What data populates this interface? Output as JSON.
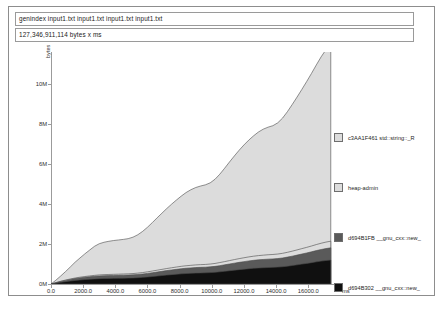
{
  "window": {
    "title": "massif memory profile"
  },
  "header": {
    "command_line": "genindex input1.txt input1.txt input1.txt input1.txt",
    "total_label": "127,346,911,114 bytes x ms"
  },
  "chart_data": {
    "type": "area",
    "title": "",
    "subtitle": "",
    "xlabel": "ms",
    "ylabel": "bytes",
    "grid": false,
    "legend_position": "right",
    "xlim": [
      0,
      17600
    ],
    "ylim": [
      0,
      11600000
    ],
    "xticks": [
      0,
      2000,
      4000,
      6000,
      8000,
      10000,
      12000,
      14000,
      16000
    ],
    "xticklabels": [
      "0.0",
      "2000.0",
      "4000.0",
      "6000.0",
      "8000.0",
      "10000.0",
      "12000.0",
      "14000.0",
      "16000.0"
    ],
    "yticks": [
      0,
      2000000,
      4000000,
      6000000,
      8000000,
      10000000
    ],
    "yticklabels": [
      "0M",
      "2M",
      "4M",
      "6M",
      "8M",
      "10M"
    ],
    "x": [
      0,
      300,
      600,
      900,
      1200,
      1500,
      1800,
      2100,
      2400,
      2700,
      3000,
      3300,
      3600,
      3900,
      4200,
      4500,
      4800,
      5100,
      5400,
      5700,
      6000,
      6300,
      6600,
      6900,
      7200,
      7500,
      7800,
      8100,
      8400,
      8700,
      9000,
      9300,
      9600,
      9900,
      10200,
      10500,
      10800,
      11100,
      11400,
      11700,
      12000,
      12300,
      12600,
      12900,
      13200,
      13500,
      13800,
      14100,
      14400,
      14700,
      15000,
      15300,
      15600,
      15900,
      16200,
      16500,
      16800,
      17100,
      17400
    ],
    "series": [
      {
        "name": "c3AA1F461 std::string::_R",
        "color": "#dcdcdc",
        "values": [
          0,
          120000,
          260000,
          420000,
          600000,
          790000,
          960000,
          1130000,
          1290000,
          1450000,
          1560000,
          1620000,
          1660000,
          1690000,
          1710000,
          1730000,
          1760000,
          1820000,
          1920000,
          2060000,
          2230000,
          2420000,
          2620000,
          2810000,
          3000000,
          3180000,
          3350000,
          3510000,
          3660000,
          3780000,
          3870000,
          3930000,
          3980000,
          4060000,
          4210000,
          4420000,
          4670000,
          4930000,
          5180000,
          5420000,
          5640000,
          5840000,
          6020000,
          6180000,
          6300000,
          6380000,
          6440000,
          6560000,
          6760000,
          7030000,
          7330000,
          7640000,
          7960000,
          8290000,
          8630000,
          8980000,
          9320000,
          9620000,
          9840000
        ]
      },
      {
        "name": "heap-admin",
        "color": "#dcdcdc",
        "values": [
          0,
          6000,
          12000,
          18000,
          24000,
          30000,
          34000,
          38000,
          42000,
          46000,
          50000,
          52000,
          54000,
          56000,
          58000,
          60000,
          62000,
          64000,
          68000,
          72000,
          78000,
          84000,
          90000,
          96000,
          102000,
          108000,
          114000,
          120000,
          124000,
          128000,
          132000,
          134000,
          136000,
          140000,
          146000,
          154000,
          162000,
          170000,
          178000,
          186000,
          194000,
          200000,
          206000,
          212000,
          216000,
          220000,
          222000,
          226000,
          232000,
          240000,
          250000,
          260000,
          270000,
          280000,
          290000,
          302000,
          314000,
          324000,
          332000
        ]
      },
      {
        "name": "d694B1FB __gnu_cxx::new_",
        "color": "#5a5a5a",
        "values": [
          0,
          22000,
          44000,
          62000,
          78000,
          92000,
          104000,
          114000,
          122000,
          130000,
          136000,
          140000,
          142000,
          144000,
          146000,
          148000,
          150000,
          154000,
          160000,
          168000,
          178000,
          190000,
          202000,
          214000,
          226000,
          236000,
          246000,
          256000,
          264000,
          270000,
          276000,
          280000,
          282000,
          288000,
          296000,
          308000,
          322000,
          336000,
          350000,
          364000,
          376000,
          388000,
          398000,
          406000,
          412000,
          418000,
          422000,
          428000,
          438000,
          452000,
          468000,
          486000,
          504000,
          522000,
          542000,
          562000,
          580000,
          596000,
          608000
        ]
      },
      {
        "name": "d694B302 __gnu_cxx::new_",
        "color": "#101010",
        "values": [
          0,
          40000,
          82000,
          118000,
          150000,
          178000,
          202000,
          222000,
          240000,
          256000,
          268000,
          276000,
          280000,
          284000,
          288000,
          292000,
          296000,
          304000,
          316000,
          332000,
          352000,
          374000,
          398000,
          422000,
          446000,
          468000,
          488000,
          508000,
          524000,
          536000,
          546000,
          554000,
          560000,
          570000,
          586000,
          610000,
          636000,
          664000,
          692000,
          718000,
          742000,
          766000,
          786000,
          802000,
          814000,
          824000,
          832000,
          844000,
          864000,
          892000,
          924000,
          958000,
          994000,
          1030000,
          1068000,
          1108000,
          1144000,
          1176000,
          1200000
        ]
      }
    ]
  }
}
